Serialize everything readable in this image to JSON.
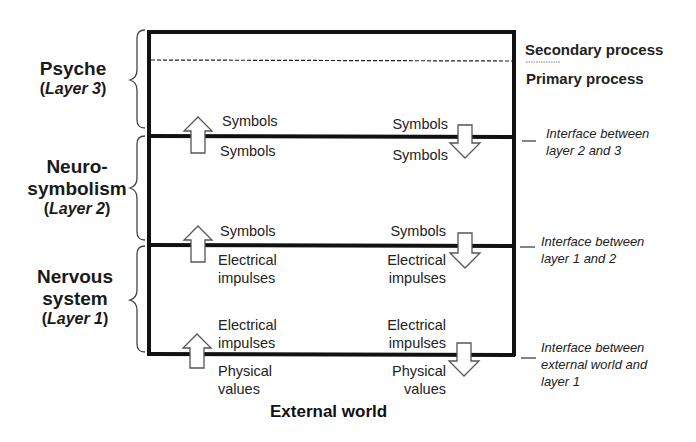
{
  "layers": [
    {
      "id": "layer3",
      "name": "Psyche",
      "sub_prefix": "(",
      "sub_italic": "Layer 3",
      "sub_suffix": ")"
    },
    {
      "id": "layer2",
      "name_line1": "Neuro-",
      "name_line2": "symbolism",
      "sub_prefix": "(",
      "sub_italic": "Layer 2",
      "sub_suffix": ")"
    },
    {
      "id": "layer1",
      "name_line1": "Nervous",
      "name_line2": "system",
      "sub_prefix": "(",
      "sub_italic": "Layer 1",
      "sub_suffix": ")"
    }
  ],
  "processes": {
    "secondary": "Secondary process",
    "primary": "Primary process"
  },
  "interfaces": [
    {
      "line1": "Interface between",
      "line2": "layer 2 and 3"
    },
    {
      "line1": "Interface between",
      "line2": "layer 1 and 2"
    },
    {
      "line1": "Interface between",
      "line2": "external world and",
      "line3": "layer 1"
    }
  ],
  "flows": {
    "i23": {
      "up_above": "Symbols",
      "up_below": "Symbols",
      "down_above": "Symbols",
      "down_below": "Symbols"
    },
    "i12": {
      "up_above": "Symbols",
      "up_below_1": "Electrical",
      "up_below_2": "impulses",
      "down_above": "Symbols",
      "down_below_1": "Electrical",
      "down_below_2": "impulses"
    },
    "i01": {
      "up_above_1": "Electrical",
      "up_above_2": "impulses",
      "up_below_1": "Physical",
      "up_below_2": "values",
      "down_above_1": "Electrical",
      "down_above_2": "impulses",
      "down_below_1": "Physical",
      "down_below_2": "values"
    }
  },
  "external": "External world",
  "colors": {
    "line": "#111111",
    "arrow_stroke": "#555555",
    "arrow_fill": "#ffffff"
  }
}
